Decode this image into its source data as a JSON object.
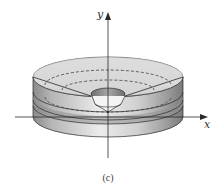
{
  "figure": {
    "caption": "(c)",
    "axes": {
      "x_label": "x",
      "y_label": "y"
    },
    "colors": {
      "line": "#2a2a2a",
      "shade_light": "#e6e6e6",
      "shade_mid": "#bdbdbd",
      "shade_dark": "#7a7a7a",
      "background": "#ffffff"
    }
  }
}
